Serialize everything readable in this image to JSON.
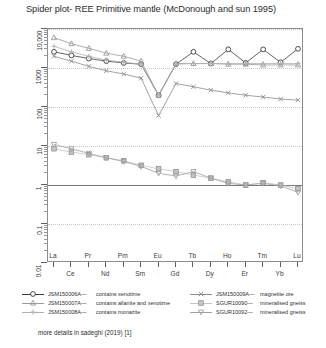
{
  "title": "Spider plot- REE Primitive mantle (McDonough and sun 1995)",
  "caption": "more details in sadeghi (2019) [1]",
  "axes": {
    "y_ticks": [
      "10,000",
      "1000",
      "100",
      "10",
      "1",
      "0.1",
      "0.01"
    ],
    "y_values": [
      10000,
      1000,
      100,
      10,
      1,
      0.1,
      0.01
    ],
    "x_labels_upper": [
      "La",
      "Pr",
      "Pm",
      "Eu",
      "Tb",
      "Ho",
      "Tm",
      "Lu"
    ],
    "x_labels_lower": [
      "Ce",
      "Nd",
      "Sm",
      "Gd",
      "Dy",
      "Er",
      "Yb"
    ]
  },
  "legend": {
    "left": [
      {
        "id": "JSM150006A",
        "desc": "contains xenotime",
        "marker": "circle-filled",
        "color": "#3c3c3c"
      },
      {
        "id": "JSM150007A",
        "desc": "contains allanite and xenotime",
        "marker": "triangle-open",
        "color": "#9a9a9a"
      },
      {
        "id": "JSM150008A",
        "desc": "contains monazite",
        "marker": "plus",
        "color": "#b0b0b0"
      }
    ],
    "right": [
      {
        "id": "JSM150009A",
        "desc": "magnetite ore",
        "marker": "cross",
        "color": "#8b8b8b"
      },
      {
        "id": "SGUR10090",
        "desc": "mineralised gneiss",
        "marker": "square-grey",
        "color": "#c4c4c4"
      },
      {
        "id": "SGUR10092",
        "desc": "mineralised gneiss",
        "marker": "triangle-down",
        "color": "#9f9f9f"
      }
    ]
  },
  "chart_data": {
    "type": "line",
    "title": "Spider plot- REE Primitive mantle (McDonough and sun 1995)",
    "xlabel": "",
    "ylabel": "",
    "yscale": "log",
    "ylim": [
      0.01,
      10000
    ],
    "grid": true,
    "legend_position": "below",
    "categories": [
      "La",
      "Ce",
      "Pr",
      "Nd",
      "Pm",
      "Sm",
      "Eu",
      "Gd",
      "Tb",
      "Dy",
      "Ho",
      "Er",
      "Tm",
      "Yb",
      "Lu"
    ],
    "series": [
      {
        "name": "JSM150006A",
        "desc": "contains xenotime",
        "color": "#3c3c3c",
        "marker": "circle-filled",
        "values": [
          2600,
          2100,
          1750,
          1500,
          1350,
          1250,
          200,
          1250,
          2600,
          1300,
          3000,
          1350,
          3000,
          1400,
          3100
        ]
      },
      {
        "name": "JSM150007A",
        "desc": "contains allanite and xenotime",
        "color": "#9a9a9a",
        "marker": "triangle-open",
        "values": [
          6000,
          4200,
          3200,
          2400,
          2000,
          1500,
          200,
          1300,
          1300,
          1300,
          1250,
          1250,
          1200,
          1200,
          1200
        ]
      },
      {
        "name": "JSM150008A",
        "desc": "contains monazite",
        "color": "#b0b0b0",
        "marker": "plus",
        "values": [
          3600,
          2600,
          2000,
          1600,
          1400,
          1250,
          200,
          1250,
          1300,
          1300,
          1300,
          1300,
          1300,
          1300,
          1300
        ]
      },
      {
        "name": "JSM150009A",
        "desc": "magnetite ore",
        "color": "#8b8b8b",
        "marker": "cross",
        "values": [
          2000,
          1500,
          1100,
          850,
          700,
          550,
          60,
          400,
          330,
          270,
          230,
          200,
          180,
          160,
          150
        ]
      },
      {
        "name": "SGUR10090",
        "desc": "mineralised gneiss",
        "color": "#c4c4c4",
        "marker": "square-grey",
        "values": [
          8.5,
          7.0,
          6.0,
          5.0,
          4.2,
          3.2,
          2.6,
          2.2,
          1.8,
          1.5,
          1.2,
          1.0,
          1.15,
          1.0,
          0.8
        ]
      },
      {
        "name": "SGUR10092",
        "desc": "mineralised gneiss",
        "color": "#9f9f9f",
        "marker": "triangle-down",
        "values": [
          11.0,
          8.5,
          6.5,
          5.0,
          4.0,
          3.0,
          2.0,
          1.7,
          2.2,
          1.5,
          1.1,
          1.0,
          1.1,
          0.95,
          0.65
        ]
      }
    ]
  }
}
